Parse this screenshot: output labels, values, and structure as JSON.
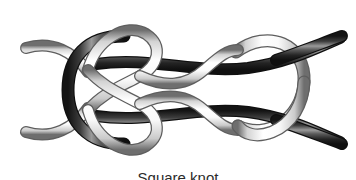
{
  "figure": {
    "panel_label": "(b)",
    "caption": "Square knot",
    "background_color": "#ffffff",
    "illustration_name": "interlocked-rope-knot-diagram"
  },
  "colors": {
    "background": "#ffffff",
    "rope_dark_core": "#3a3a3a",
    "rope_dark_edge": "#141414",
    "rope_dark_highlight": "#b8b8b8",
    "rope_light_core": "#fbfbfb",
    "rope_light_edge": "#6e6e6e",
    "rope_light_shade": "#cfcfcf",
    "label_text": "#2b2b2b",
    "caption_text": "#2b2b2b"
  },
  "illustration": {
    "rope_count": 2,
    "ropes": [
      {
        "name": "dark-rope",
        "shade": "dark",
        "entry_side": "right",
        "exits": [
          "top-right",
          "bottom-right"
        ]
      },
      {
        "name": "light-rope",
        "shade": "light",
        "entry_side": "left",
        "exits": [
          "top-left",
          "bottom-left"
        ]
      }
    ],
    "crossings": [
      {
        "name": "left-interlock",
        "x": 88,
        "y": 82,
        "over": "dark-rope"
      },
      {
        "name": "upper-left-crossing",
        "x": 116,
        "y": 50,
        "over": "light-rope"
      },
      {
        "name": "upper-right-crossing",
        "x": 196,
        "y": 58,
        "over": "light-rope"
      },
      {
        "name": "lower-left-crossing",
        "x": 116,
        "y": 126,
        "over": "light-rope"
      },
      {
        "name": "lower-right-crossing",
        "x": 196,
        "y": 118,
        "over": "light-rope"
      },
      {
        "name": "right-loop-crossing",
        "x": 286,
        "y": 62,
        "over": "dark-rope"
      },
      {
        "name": "right-loop-crossing-lower",
        "x": 286,
        "y": 116,
        "over": "dark-rope"
      }
    ]
  }
}
